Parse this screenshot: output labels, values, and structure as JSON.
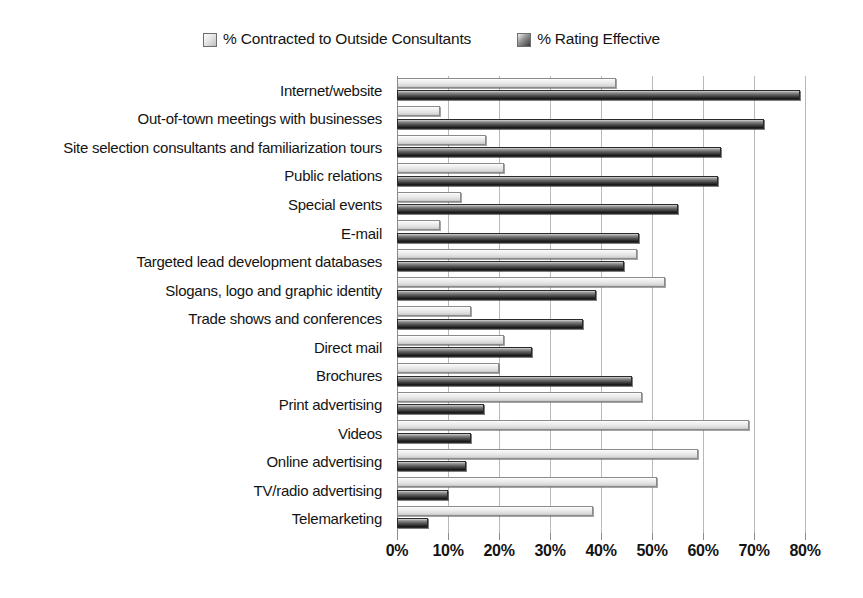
{
  "chart_data": {
    "type": "bar",
    "orientation": "horizontal",
    "title": "",
    "subtitle": "",
    "xlabel": "",
    "ylabel": "",
    "xlim": [
      0,
      80
    ],
    "xtick_labels": [
      "0%",
      "10%",
      "20%",
      "30%",
      "40%",
      "50%",
      "60%",
      "70%",
      "80%"
    ],
    "xticks": [
      0,
      10,
      20,
      30,
      40,
      50,
      60,
      70,
      80
    ],
    "grid": true,
    "legend_position": "top-center",
    "categories": [
      "Internet/website",
      "Out-of-town meetings with businesses",
      "Site selection consultants and familiarization tours",
      "Public relations",
      "Special events",
      "E-mail",
      "Targeted lead development databases",
      "Slogans, logo and graphic identity",
      "Trade shows and conferences",
      "Direct mail",
      "Brochures",
      "Print advertising",
      "Videos",
      "Online advertising",
      "TV/radio advertising",
      "Telemarketing"
    ],
    "series": [
      {
        "name": "% Contracted to Outside Consultants",
        "color": "#e9e9e9",
        "values": [
          43,
          8.5,
          17.5,
          21,
          12.5,
          8.5,
          47,
          52.5,
          14.5,
          21,
          20,
          48,
          69,
          59,
          51,
          38.5
        ]
      },
      {
        "name": "% Rating Effective",
        "color": "#3a3a3a",
        "values": [
          79,
          72,
          63.5,
          63,
          55,
          47.5,
          44.5,
          39,
          36.5,
          26.5,
          46,
          17,
          14.5,
          13.5,
          10,
          6
        ]
      }
    ]
  },
  "legend": {
    "items": [
      {
        "label": "% Contracted to Outside Consultants",
        "swatch": "light"
      },
      {
        "label": "% Rating Effective",
        "swatch": "dark"
      }
    ]
  }
}
